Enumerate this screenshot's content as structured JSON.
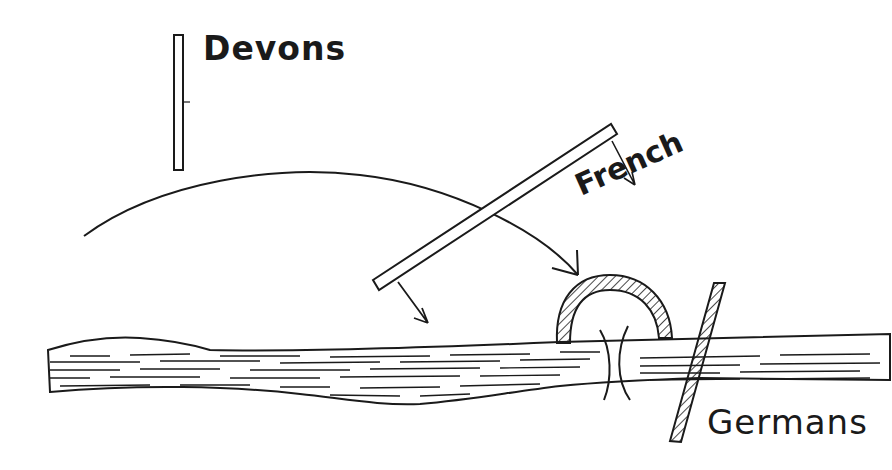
{
  "diagram": {
    "labels": {
      "devons": "Devons",
      "french": "French",
      "germans": "Germans"
    },
    "colors": {
      "ink": "#1a1a1a",
      "paper": "#ffffff"
    },
    "elements": [
      {
        "name": "devons-line",
        "type": "unit-bar"
      },
      {
        "name": "french-line",
        "type": "unit-bar",
        "advance_arrows": 2
      },
      {
        "name": "devons-advance-arc",
        "type": "curved-arrow"
      },
      {
        "name": "german-salient",
        "type": "hatched-semicircle"
      },
      {
        "name": "german-line",
        "type": "hatched-bar"
      },
      {
        "name": "bridge",
        "type": "crossing-marks"
      },
      {
        "name": "river",
        "type": "water"
      }
    ]
  }
}
